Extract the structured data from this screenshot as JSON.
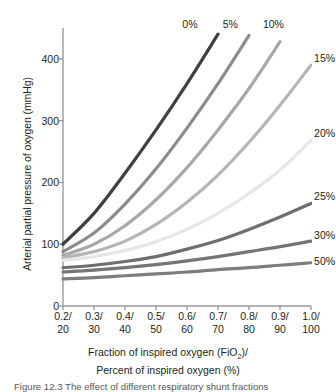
{
  "chart_data": {
    "type": "line",
    "title": "",
    "xlabel": "Fraction of inspired oxygen (FiO2)/ Percent of inspired oxygen (%)",
    "ylabel": "Arterial partial pressure of oxygen (mmHg)",
    "xlim": [
      0.2,
      1.0
    ],
    "ylim": [
      0,
      450
    ],
    "grid": false,
    "legend_position": "inline-right-of-curve-ends",
    "x": [
      0.2,
      0.3,
      0.4,
      0.5,
      0.6,
      0.7,
      0.8,
      0.9,
      1.0
    ],
    "x_tick_labels_fraction": [
      "0.2/",
      "0.3/",
      "0.4/",
      "0.5/",
      "0.6/",
      "0.7/",
      "0.8/",
      "0.9/",
      "1.0/"
    ],
    "x_tick_labels_percent": [
      "20",
      "30",
      "40",
      "50",
      "60",
      "70",
      "80",
      "90",
      "100"
    ],
    "y_ticks": [
      0,
      100,
      200,
      300,
      400
    ],
    "series": [
      {
        "name": "0%",
        "label": "0%",
        "color": "#3f3f3f",
        "values": [
          100,
          150,
          215,
          285,
          360,
          440,
          null,
          null,
          null
        ],
        "label_x": 0.585,
        "label_y": 455
      },
      {
        "name": "5%",
        "label": "5%",
        "color": "#8c8c8c",
        "values": [
          88,
          118,
          165,
          222,
          288,
          360,
          438,
          null,
          null
        ],
        "label_x": 0.715,
        "label_y": 455
      },
      {
        "name": "10%",
        "label": "10%",
        "color": "#a8a8a8",
        "values": [
          82,
          100,
          130,
          172,
          224,
          285,
          352,
          428,
          null
        ],
        "label_x": 0.845,
        "label_y": 455
      },
      {
        "name": "15%",
        "label": "15%",
        "color": "#b5b5b5",
        "values": [
          78,
          88,
          105,
          132,
          168,
          212,
          265,
          325,
          390
        ],
        "label_x": 1.01,
        "label_y": 400
      },
      {
        "name": "20%",
        "label": "20%",
        "color": "#e6e6e6",
        "values": [
          74,
          80,
          90,
          104,
          124,
          150,
          182,
          220,
          268
        ],
        "label_x": 1.01,
        "label_y": 278
      },
      {
        "name": "25%",
        "label": "25%",
        "color": "#6e6e6e",
        "values": [
          62,
          66,
          72,
          80,
          92,
          106,
          124,
          144,
          166
        ],
        "label_x": 1.01,
        "label_y": 176
      },
      {
        "name": "30%",
        "label": "30%",
        "color": "#757575",
        "values": [
          55,
          58,
          62,
          67,
          73,
          80,
          88,
          96,
          105
        ],
        "label_x": 1.01,
        "label_y": 114
      },
      {
        "name": "50%",
        "label": "50%",
        "color": "#7d7d7d",
        "values": [
          44,
          46,
          49,
          52,
          55,
          59,
          62,
          66,
          70
        ],
        "label_x": 1.01,
        "label_y": 72
      }
    ]
  },
  "axes": {
    "y_title": "Arterial partial pressure of oxygen (mmHg)",
    "y_ticks": [
      "400",
      "300",
      "200",
      "100",
      "0"
    ],
    "x_title_line1_prefix": "Fraction of inspired oxygen (FiO",
    "x_title_line1_sub": "2",
    "x_title_line1_suffix": ")/",
    "x_title_line2": "Percent of inspired oxygen (%)",
    "x_ticks": [
      {
        "frac": "0.2/",
        "pct": "20"
      },
      {
        "frac": "0.3/",
        "pct": "30"
      },
      {
        "frac": "0.4/",
        "pct": "40"
      },
      {
        "frac": "0.5/",
        "pct": "50"
      },
      {
        "frac": "0.6/",
        "pct": "60"
      },
      {
        "frac": "0.7/",
        "pct": "70"
      },
      {
        "frac": "0.8/",
        "pct": "80"
      },
      {
        "frac": "0.9/",
        "pct": "90"
      },
      {
        "frac": "1.0/",
        "pct": "100"
      }
    ]
  },
  "caption": {
    "text": "Figure 12.3  The effect of different respiratory shunt fractions"
  },
  "colors": {
    "axis": "#9a9a9a",
    "text": "#231f20",
    "caption": "#58585b"
  }
}
